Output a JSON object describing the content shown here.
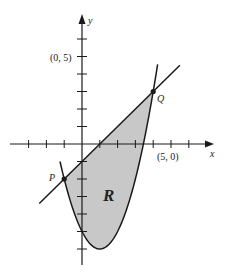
{
  "figure": {
    "axes": {
      "x_label": "x",
      "y_label": "y",
      "x_tick_label": "(5, 0)",
      "y_tick_label": "(0, 5)",
      "x_range": [
        -4,
        7
      ],
      "y_range": [
        -7,
        6
      ],
      "tick_spacing": 1
    },
    "curves": [
      {
        "name": "parabola",
        "equation": "y = x^2 - 2x - 5"
      },
      {
        "name": "line",
        "equation": "y = x - 1"
      }
    ],
    "points": [
      {
        "label": "P",
        "x": -1,
        "y": -2
      },
      {
        "label": "Q",
        "x": 4,
        "y": 3
      }
    ],
    "region": {
      "label": "R",
      "fill": "#c8c8c8"
    },
    "colors": {
      "stroke": "#1a1a1a",
      "fill": "#c8c8c8",
      "background": "#ffffff"
    }
  }
}
